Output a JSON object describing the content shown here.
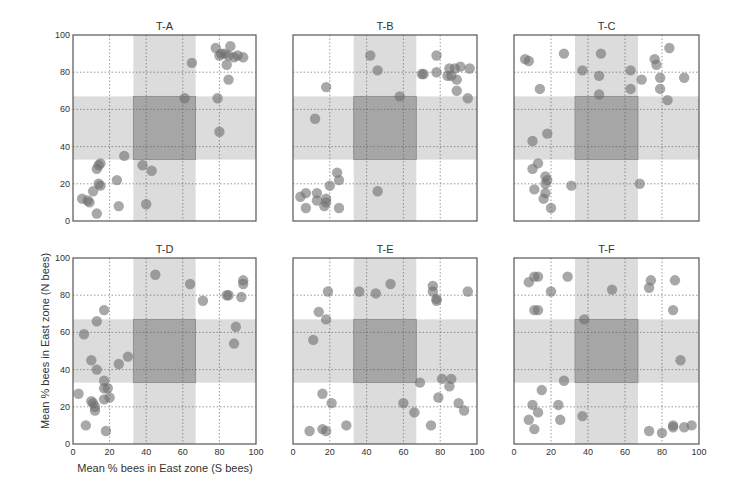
{
  "figure": {
    "xlabel": "Mean % bees in East zone (S bees)",
    "ylabel": "Mean % bees in East zone (N bees)",
    "colors": {
      "band": "#dcdcdc",
      "center": "#a6a6a6",
      "marker": "#6e6e6e",
      "grid": "#555555",
      "axis": "#555555"
    }
  },
  "chart_data": [
    {
      "type": "scatter",
      "title": "T-A",
      "xlim": [
        0,
        100
      ],
      "ylim": [
        0,
        100
      ],
      "xticks": [
        0,
        20,
        40,
        60,
        80,
        100
      ],
      "yticks": [
        0,
        20,
        40,
        60,
        80,
        100
      ],
      "grid": true,
      "shaded_bands": {
        "x": [
          33,
          67
        ],
        "y": [
          33,
          67
        ]
      },
      "points": [
        [
          5,
          12
        ],
        [
          8,
          11
        ],
        [
          9,
          10
        ],
        [
          11,
          16
        ],
        [
          13,
          28
        ],
        [
          14,
          30
        ],
        [
          15,
          31
        ],
        [
          14,
          20
        ],
        [
          15,
          19
        ],
        [
          13,
          4
        ],
        [
          24,
          22
        ],
        [
          25,
          8
        ],
        [
          28,
          35
        ],
        [
          38,
          30
        ],
        [
          40,
          9
        ],
        [
          43,
          27
        ],
        [
          61,
          66
        ],
        [
          65,
          85
        ],
        [
          78,
          93
        ],
        [
          80,
          89
        ],
        [
          81,
          90
        ],
        [
          83,
          90
        ],
        [
          85,
          89
        ],
        [
          86,
          94
        ],
        [
          88,
          88
        ],
        [
          90,
          89
        ],
        [
          93,
          88
        ],
        [
          84,
          84
        ],
        [
          85,
          76
        ],
        [
          79,
          66
        ],
        [
          80,
          48
        ]
      ]
    },
    {
      "type": "scatter",
      "title": "T-B",
      "xlim": [
        0,
        100
      ],
      "ylim": [
        0,
        100
      ],
      "xticks": [
        0,
        20,
        40,
        60,
        80,
        100
      ],
      "yticks": [
        0,
        20,
        40,
        60,
        80,
        100
      ],
      "grid": true,
      "shaded_bands": {
        "x": [
          33,
          67
        ],
        "y": [
          33,
          67
        ]
      },
      "points": [
        [
          4,
          13
        ],
        [
          7,
          15
        ],
        [
          7,
          7
        ],
        [
          13,
          15
        ],
        [
          13,
          11
        ],
        [
          17,
          8
        ],
        [
          18,
          12
        ],
        [
          18,
          10
        ],
        [
          20,
          19
        ],
        [
          24,
          26
        ],
        [
          25,
          22
        ],
        [
          25,
          7
        ],
        [
          18,
          72
        ],
        [
          12,
          55
        ],
        [
          42,
          89
        ],
        [
          46,
          81
        ],
        [
          58,
          67
        ],
        [
          70,
          79
        ],
        [
          71,
          79
        ],
        [
          78,
          89
        ],
        [
          78,
          80
        ],
        [
          84,
          78
        ],
        [
          85,
          82
        ],
        [
          86,
          78
        ],
        [
          88,
          82
        ],
        [
          89,
          76
        ],
        [
          91,
          83
        ],
        [
          96,
          82
        ],
        [
          89,
          70
        ],
        [
          95,
          66
        ],
        [
          46,
          16
        ]
      ]
    },
    {
      "type": "scatter",
      "title": "T-C",
      "xlim": [
        0,
        100
      ],
      "ylim": [
        0,
        100
      ],
      "xticks": [
        0,
        20,
        40,
        60,
        80,
        100
      ],
      "yticks": [
        0,
        20,
        40,
        60,
        80,
        100
      ],
      "grid": true,
      "shaded_bands": {
        "x": [
          33,
          67
        ],
        "y": [
          33,
          67
        ]
      },
      "points": [
        [
          6,
          87
        ],
        [
          8,
          86
        ],
        [
          14,
          71
        ],
        [
          27,
          90
        ],
        [
          37,
          81
        ],
        [
          47,
          90
        ],
        [
          46,
          78
        ],
        [
          63,
          81
        ],
        [
          63,
          71
        ],
        [
          69,
          76
        ],
        [
          76,
          87
        ],
        [
          77,
          84
        ],
        [
          84,
          93
        ],
        [
          79,
          77
        ],
        [
          79,
          71
        ],
        [
          83,
          65
        ],
        [
          92,
          77
        ],
        [
          46,
          68
        ],
        [
          18,
          47
        ],
        [
          10,
          43
        ],
        [
          10,
          28
        ],
        [
          13,
          31
        ],
        [
          17,
          24
        ],
        [
          18,
          22
        ],
        [
          17,
          20
        ],
        [
          11,
          17
        ],
        [
          17,
          15
        ],
        [
          16,
          12
        ],
        [
          20,
          7
        ],
        [
          31,
          19
        ],
        [
          68,
          20
        ]
      ]
    },
    {
      "type": "scatter",
      "title": "T-D",
      "xlim": [
        0,
        100
      ],
      "ylim": [
        0,
        100
      ],
      "xticks": [
        0,
        20,
        40,
        60,
        80,
        100
      ],
      "yticks": [
        0,
        20,
        40,
        60,
        80,
        100
      ],
      "grid": true,
      "shaded_bands": {
        "x": [
          33,
          67
        ],
        "y": [
          33,
          67
        ]
      },
      "points": [
        [
          3,
          27
        ],
        [
          6,
          59
        ],
        [
          10,
          45
        ],
        [
          13,
          66
        ],
        [
          17,
          72
        ],
        [
          11,
          22
        ],
        [
          10,
          23
        ],
        [
          12,
          20
        ],
        [
          12,
          18
        ],
        [
          13,
          40
        ],
        [
          17,
          34
        ],
        [
          17,
          30
        ],
        [
          19,
          30
        ],
        [
          20,
          25
        ],
        [
          17,
          24
        ],
        [
          7,
          10
        ],
        [
          18,
          7
        ],
        [
          25,
          43
        ],
        [
          30,
          47
        ],
        [
          45,
          91
        ],
        [
          64,
          86
        ],
        [
          71,
          77
        ],
        [
          84,
          80
        ],
        [
          85,
          80
        ],
        [
          92,
          79
        ],
        [
          93,
          88
        ],
        [
          93,
          86
        ],
        [
          89,
          63
        ],
        [
          88,
          54
        ]
      ]
    },
    {
      "type": "scatter",
      "title": "T-E",
      "xlim": [
        0,
        100
      ],
      "ylim": [
        0,
        100
      ],
      "xticks": [
        0,
        20,
        40,
        60,
        80,
        100
      ],
      "yticks": [
        0,
        20,
        40,
        60,
        80,
        100
      ],
      "grid": true,
      "shaded_bands": {
        "x": [
          33,
          67
        ],
        "y": [
          33,
          67
        ]
      },
      "points": [
        [
          19,
          82
        ],
        [
          36,
          82
        ],
        [
          45,
          81
        ],
        [
          53,
          86
        ],
        [
          76,
          85
        ],
        [
          76,
          82
        ],
        [
          78,
          78
        ],
        [
          78,
          77
        ],
        [
          95,
          82
        ],
        [
          14,
          71
        ],
        [
          18,
          67
        ],
        [
          11,
          56
        ],
        [
          69,
          33
        ],
        [
          81,
          35
        ],
        [
          86,
          35
        ],
        [
          85,
          31
        ],
        [
          79,
          25
        ],
        [
          16,
          27
        ],
        [
          21,
          22
        ],
        [
          60,
          22
        ],
        [
          66,
          17
        ],
        [
          90,
          22
        ],
        [
          93,
          18
        ],
        [
          9,
          7
        ],
        [
          16,
          8
        ],
        [
          18,
          7
        ],
        [
          29,
          10
        ],
        [
          75,
          10
        ]
      ]
    },
    {
      "type": "scatter",
      "title": "T-F",
      "xlim": [
        0,
        100
      ],
      "ylim": [
        0,
        100
      ],
      "xticks": [
        0,
        20,
        40,
        60,
        80,
        100
      ],
      "yticks": [
        0,
        20,
        40,
        60,
        80,
        100
      ],
      "grid": true,
      "shaded_bands": {
        "x": [
          33,
          67
        ],
        "y": [
          33,
          67
        ]
      },
      "points": [
        [
          8,
          87
        ],
        [
          11,
          90
        ],
        [
          13,
          90
        ],
        [
          29,
          90
        ],
        [
          20,
          82
        ],
        [
          53,
          83
        ],
        [
          74,
          88
        ],
        [
          73,
          84
        ],
        [
          87,
          88
        ],
        [
          11,
          72
        ],
        [
          13,
          72
        ],
        [
          86,
          72
        ],
        [
          38,
          67
        ],
        [
          90,
          45
        ],
        [
          27,
          34
        ],
        [
          15,
          29
        ],
        [
          10,
          21
        ],
        [
          13,
          17
        ],
        [
          8,
          13
        ],
        [
          24,
          21
        ],
        [
          25,
          13
        ],
        [
          11,
          8
        ],
        [
          37,
          15
        ],
        [
          73,
          7
        ],
        [
          80,
          6
        ],
        [
          86,
          10
        ],
        [
          86,
          9
        ],
        [
          92,
          9
        ],
        [
          96,
          10
        ]
      ]
    }
  ]
}
